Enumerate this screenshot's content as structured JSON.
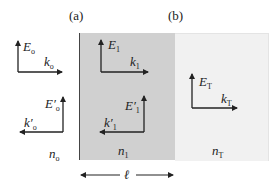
{
  "panels": {
    "a": "(a)",
    "b": "(b)"
  },
  "regions": {
    "incident": {
      "index_label": "n",
      "index_sub": "o",
      "color": "#ffffff"
    },
    "slab": {
      "index_label": "n",
      "index_sub": "1",
      "color": "#d0d0d0"
    },
    "transmitted": {
      "index_label": "n",
      "index_sub": "T",
      "color": "#f1f1f1"
    }
  },
  "vectors": {
    "E_o": {
      "label": "E",
      "sub": "o",
      "prime": ""
    },
    "k_o": {
      "label": "k",
      "sub": "o",
      "prime": ""
    },
    "E_o_prime": {
      "label": "E",
      "sub": "o",
      "prime": "′"
    },
    "k_o_prime": {
      "label": "k",
      "sub": "o",
      "prime": "′"
    },
    "E_1": {
      "label": "E",
      "sub": "1",
      "prime": ""
    },
    "k_1": {
      "label": "k",
      "sub": "1",
      "prime": ""
    },
    "E_1_prime": {
      "label": "E",
      "sub": "1",
      "prime": "′"
    },
    "k_1_prime": {
      "label": "k",
      "sub": "1",
      "prime": "′"
    },
    "E_T": {
      "label": "E",
      "sub": "T",
      "prime": ""
    },
    "k_T": {
      "label": "k",
      "sub": "T",
      "prime": ""
    }
  },
  "thickness": {
    "label": "ℓ"
  }
}
